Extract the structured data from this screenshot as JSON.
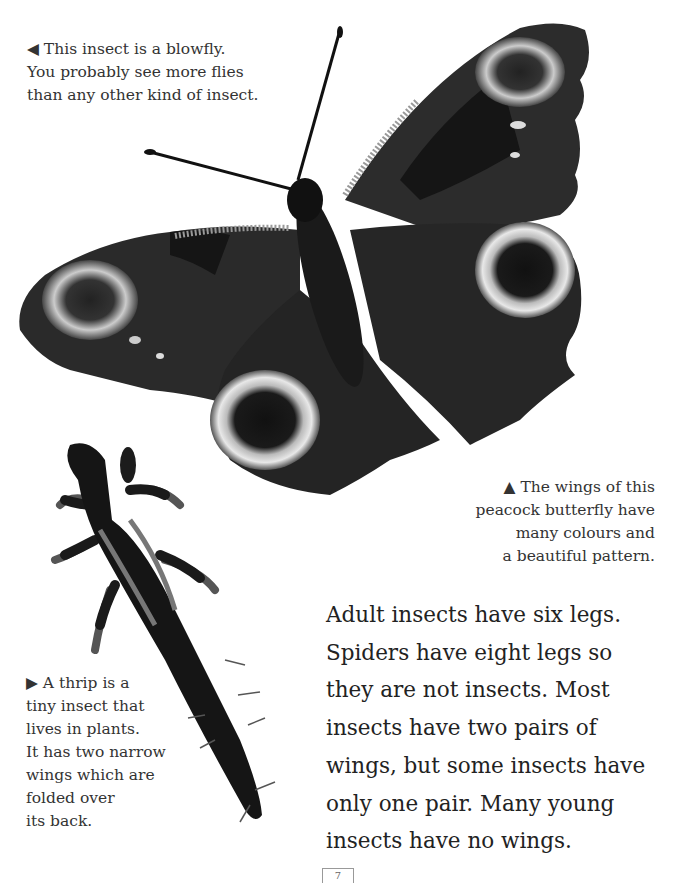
{
  "captions": {
    "blowfly": {
      "marker": "◀",
      "lines": [
        "This insect is a blowfly.",
        "You probably see more flies",
        "than any other kind of insect."
      ]
    },
    "butterfly": {
      "marker": "▲",
      "lines": [
        "The wings of this",
        "peacock butterfly have",
        "many colours and",
        "a beautiful pattern."
      ]
    },
    "thrip": {
      "marker": "▶",
      "lines": [
        "A thrip is a",
        "tiny insect that",
        "lives in plants.",
        "It has two narrow",
        "wings which are",
        "folded over",
        "its back."
      ]
    }
  },
  "main_text": {
    "lines": [
      "Adult insects have six legs.",
      "Spiders have eight legs so",
      "they are not insects. Most",
      "insects have two pairs of",
      "wings, but some insects have",
      "only one pair. Many young",
      "insects have no wings."
    ]
  },
  "images": {
    "butterfly": "peacock butterfly photo (grayscale)",
    "thrip": "thrip photo (grayscale)"
  },
  "page_number": "7"
}
